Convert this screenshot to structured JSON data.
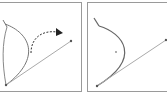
{
  "figure": {
    "panels": [
      {
        "id": "before",
        "label": "",
        "elements": [
          "original-curve",
          "reshaped-curve",
          "dashed-drag-arrow",
          "direction-handle-line",
          "anchor-point",
          "handle-endpoint"
        ]
      },
      {
        "id": "after",
        "label": "",
        "elements": [
          "resulting-curve",
          "direction-handle-line",
          "anchor-point",
          "handle-endpoint",
          "center-point"
        ]
      }
    ],
    "colors": {
      "border": "#9a9a9a",
      "curve": "#777777",
      "handle": "#aaaaaa",
      "arrow": "#222222",
      "background": "#ffffff"
    }
  }
}
